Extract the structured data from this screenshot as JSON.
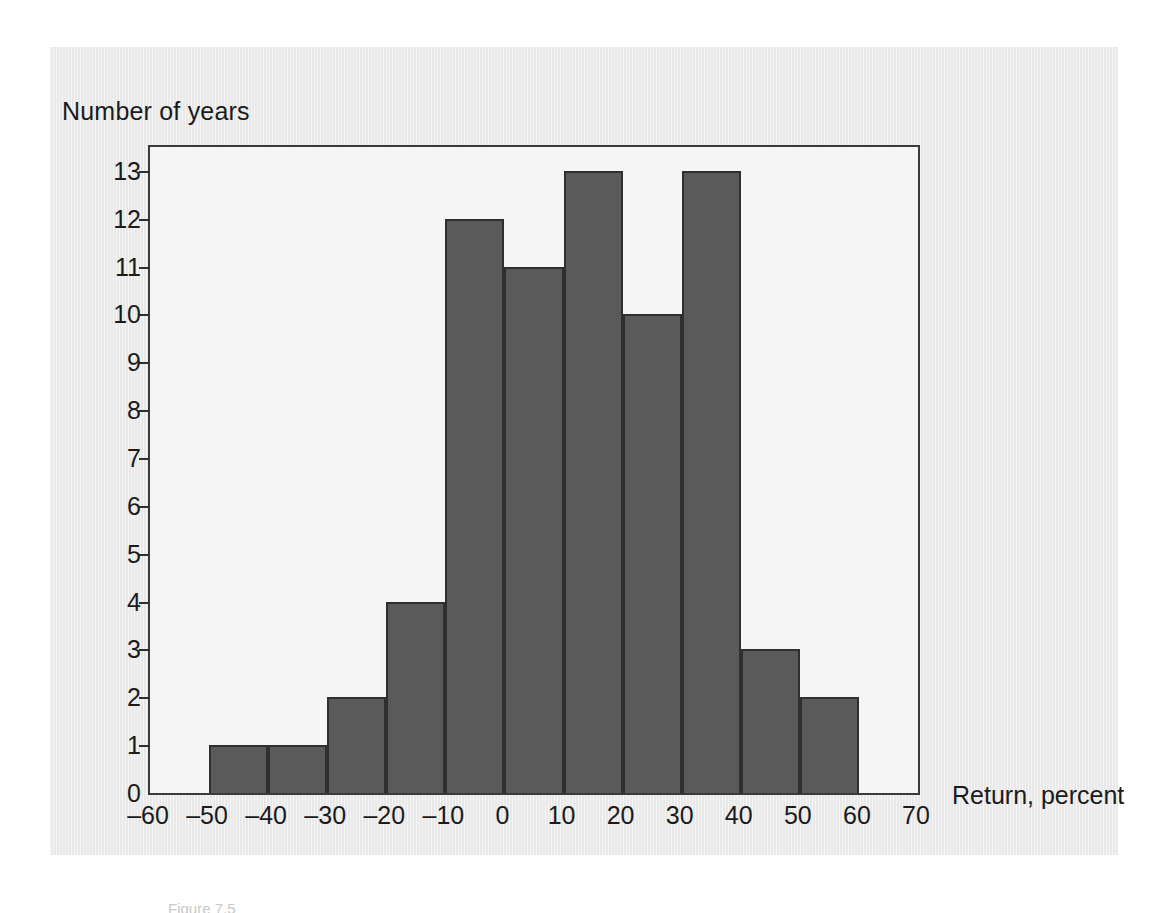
{
  "figure": {
    "background_color": "#ebebeb",
    "plot_background_color": "#f5f5f5",
    "bar_color": "#5a5a5a",
    "axis_color": "#2f2f2f",
    "caption": "Figure 7.5"
  },
  "chart_data": {
    "type": "bar",
    "title": "",
    "subtitle": "",
    "xlabel": "Return, percent",
    "ylabel": "Number of years",
    "xlim": [
      -60,
      70
    ],
    "ylim": [
      0,
      13.5
    ],
    "bin_width": 10,
    "grid": false,
    "legend": null,
    "xticks": [
      -60,
      -50,
      -40,
      -30,
      -20,
      -10,
      0,
      10,
      20,
      30,
      40,
      50,
      60,
      70
    ],
    "xtick_labels": [
      "–60",
      "–50",
      "–40",
      "–30",
      "–20",
      "–10",
      "0",
      "10",
      "20",
      "30",
      "40",
      "50",
      "60",
      "70"
    ],
    "yticks": [
      0,
      1,
      2,
      3,
      4,
      5,
      6,
      7,
      8,
      9,
      10,
      11,
      12,
      13
    ],
    "ytick_labels": [
      "0",
      "1",
      "2",
      "3",
      "4",
      "5",
      "6",
      "7",
      "8",
      "9",
      "10",
      "11",
      "12",
      "13"
    ],
    "categories": [
      "–60 to –50",
      "–50 to –40",
      "–40 to –30",
      "–30 to –20",
      "–20 to –10",
      "–10 to 0",
      "0 to 10",
      "10 to 20",
      "20 to 30",
      "30 to 40",
      "40 to 50",
      "50 to 60",
      "60 to 70"
    ],
    "bin_starts": [
      -60,
      -50,
      -40,
      -30,
      -20,
      -10,
      0,
      10,
      20,
      30,
      40,
      50,
      60
    ],
    "values": [
      0,
      1,
      1,
      2,
      4,
      12,
      11,
      13,
      10,
      13,
      3,
      2,
      0
    ]
  }
}
